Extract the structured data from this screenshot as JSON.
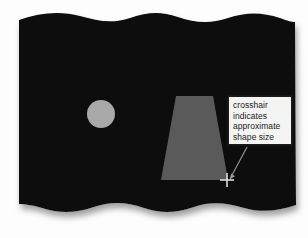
{
  "figure": {
    "name": "shape-size-crosshair-illustration",
    "background_color": "#fdfdfd",
    "card": {
      "name": "torn-edge-dark-card",
      "fill_color": "#0a0a0a",
      "shadow_color": "#b9b9b9",
      "edge_style": "wavy-top-and-bottom",
      "wave_crests_top": 3,
      "wave_crests_bottom": 3
    },
    "shapes": [
      {
        "name": "circle-shape",
        "type": "circle",
        "fill_color": "#a9a9a9",
        "center_x": 101,
        "center_y": 114,
        "radius": 14
      },
      {
        "name": "trapezoid-shape",
        "type": "trapezoid",
        "fill_color": "#5a5a5a",
        "top_left_x": 176,
        "top_right_x": 213,
        "top_y": 96,
        "bottom_left_x": 161,
        "bottom_right_x": 228,
        "bottom_y": 180
      }
    ],
    "crosshair": {
      "name": "crosshair-marker",
      "color": "#d8d8d8",
      "center_x": 227,
      "center_y": 180,
      "arm_length": 6
    },
    "leader_line": {
      "name": "callout-leader-line",
      "color": "#9a9a9a",
      "from_x": 247,
      "from_y": 147,
      "to_x": 230,
      "to_y": 177
    }
  },
  "callout": {
    "name": "annotation-callout",
    "border_color": "#1a1a1a",
    "background_color": "#f4f4f2",
    "text_color": "#1b1b1b",
    "lines": [
      "crosshair",
      "indicates",
      "approximate",
      "shape size"
    ]
  }
}
